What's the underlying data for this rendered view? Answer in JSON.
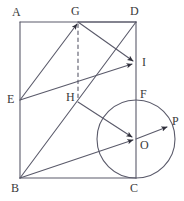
{
  "figure": {
    "kind": "plane-geometry-diagram",
    "canvas": {
      "width": 184,
      "height": 201
    },
    "stroke_color": "#5a5a6a",
    "label_color": "#3a3a3a",
    "background_color": "#ffffff",
    "points": [
      {
        "id": "A",
        "label": "A",
        "x": 20,
        "y": 22,
        "label_x": 12,
        "label_y": 6,
        "on": "rectangle-corner-top-left"
      },
      {
        "id": "G",
        "label": "G",
        "x": 78,
        "y": 22,
        "label_x": 71,
        "label_y": 5,
        "on": "segment-AD"
      },
      {
        "id": "D",
        "label": "D",
        "x": 136,
        "y": 22,
        "label_x": 130,
        "label_y": 5,
        "on": "rectangle-corner-top-right"
      },
      {
        "id": "I",
        "label": "I",
        "x": 136,
        "y": 63,
        "label_x": 142,
        "label_y": 56,
        "on": "segment-DC"
      },
      {
        "id": "E",
        "label": "E",
        "x": 20,
        "y": 100,
        "label_x": 7,
        "label_y": 93,
        "on": "segment-AB"
      },
      {
        "id": "H",
        "label": "H",
        "x": 78,
        "y": 100,
        "label_x": 66,
        "label_y": 91,
        "on": "segment-BD"
      },
      {
        "id": "F",
        "label": "F",
        "x": 136,
        "y": 100,
        "label_x": 140,
        "label_y": 88,
        "on": "circle-top"
      },
      {
        "id": "O",
        "label": "O",
        "x": 136,
        "y": 139,
        "label_x": 140,
        "label_y": 139,
        "on": "circle-center"
      },
      {
        "id": "P",
        "label": "P",
        "x": 170,
        "y": 125,
        "label_x": 172,
        "label_y": 115,
        "on": "circle"
      },
      {
        "id": "B",
        "label": "B",
        "x": 20,
        "y": 178,
        "label_x": 11,
        "label_y": 182,
        "on": "rectangle-corner-bottom-left"
      },
      {
        "id": "C",
        "label": "C",
        "x": 136,
        "y": 178,
        "label_x": 130,
        "label_y": 182,
        "on": "rectangle-corner-bottom-right"
      }
    ],
    "rectangle": {
      "id": "ABCD",
      "corners": [
        "A",
        "B",
        "C",
        "D"
      ],
      "left": 20,
      "top": 22,
      "right": 136,
      "bottom": 178,
      "width": 116,
      "height": 156
    },
    "circle": {
      "id": "circle-O",
      "center": "O",
      "cx": 136,
      "cy": 139,
      "r": 39,
      "tangent_at": "C",
      "passes_through": [
        "F",
        "C",
        "P"
      ]
    },
    "segments": [
      {
        "id": "AD",
        "from": "A",
        "to": "D",
        "style": "solid",
        "arrow": "none"
      },
      {
        "id": "AB",
        "from": "A",
        "to": "B",
        "style": "solid",
        "arrow": "none"
      },
      {
        "id": "BC",
        "from": "B",
        "to": "C",
        "style": "solid",
        "arrow": "none"
      },
      {
        "id": "DC",
        "from": "D",
        "to": "C",
        "style": "solid",
        "arrow": "none"
      },
      {
        "id": "EG",
        "from": "E",
        "to": "G",
        "style": "solid",
        "arrow": "end"
      },
      {
        "id": "EI",
        "from": "E",
        "to": "I",
        "style": "solid",
        "arrow": "end"
      },
      {
        "id": "BD",
        "from": "B",
        "to": "D",
        "style": "solid",
        "arrow": "none"
      },
      {
        "id": "GD",
        "from": "G",
        "to": "D",
        "style": "solid",
        "arrow": "none"
      },
      {
        "id": "GI",
        "from": "G",
        "to": "I",
        "style": "solid",
        "arrow": "end"
      },
      {
        "id": "BP",
        "from": "B",
        "to": "P",
        "style": "solid",
        "arrow": "end",
        "through": [
          "O"
        ]
      },
      {
        "id": "HO",
        "from": "H",
        "to": "O",
        "style": "solid",
        "arrow": "end"
      },
      {
        "id": "GH",
        "from": "G",
        "to": "H",
        "style": "dashed",
        "arrow": "none"
      }
    ],
    "arrow_markers": [
      {
        "at": "G",
        "on_segment": "EG"
      },
      {
        "at": "I",
        "on_segment": "EI"
      },
      {
        "at": "I",
        "on_segment": "GI"
      },
      {
        "at": "O",
        "on_segment": "BP"
      },
      {
        "at": "O",
        "on_segment": "HO"
      },
      {
        "at": "P",
        "on_segment": "BP"
      }
    ]
  }
}
